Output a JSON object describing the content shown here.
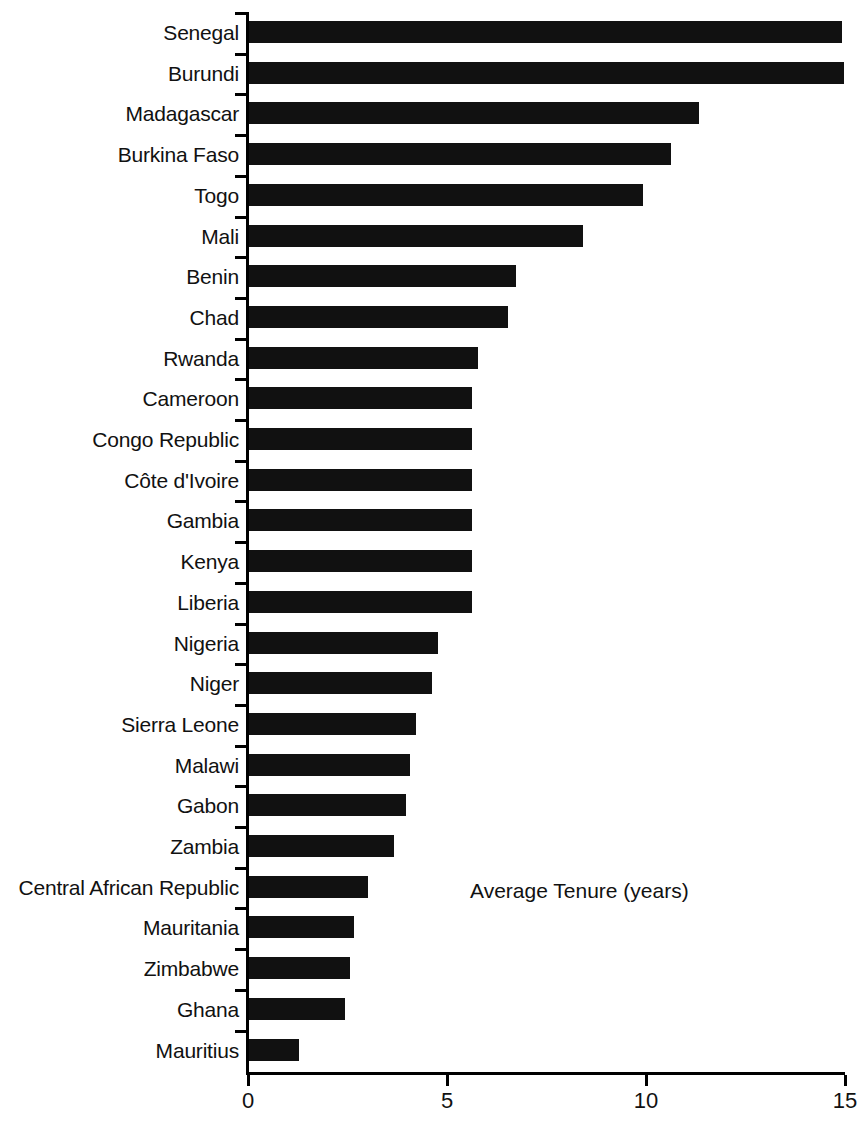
{
  "chart_data": {
    "type": "bar",
    "orientation": "horizontal",
    "title": "",
    "subtitle": "",
    "xlabel": "Average Tenure (years)",
    "ylabel": "",
    "annotation": "Average Tenure (years)",
    "xlim": [
      0,
      15
    ],
    "x_ticks": [
      0,
      5,
      10,
      15
    ],
    "x_tick_labels": [
      "0",
      "5",
      "10",
      "15"
    ],
    "grid": false,
    "legend": false,
    "bar_color": "#111111",
    "axis_color": "#000000",
    "background": "#ffffff",
    "categories": [
      "Senegal",
      "Burundi",
      "Madagascar",
      "Burkina Faso",
      "Togo",
      "Mali",
      "Benin",
      "Chad",
      "Rwanda",
      "Cameroon",
      "Congo Republic",
      "Côte d'Ivoire",
      "Gambia",
      "Kenya",
      "Liberia",
      "Nigeria",
      "Niger",
      "Sierra Leone",
      "Malawi",
      "Gabon",
      "Zambia",
      "Central African Republic",
      "Mauritania",
      "Zimbabwe",
      "Ghana",
      "Mauritius"
    ],
    "values": [
      14.9,
      14.95,
      11.3,
      10.6,
      9.9,
      8.4,
      6.7,
      6.5,
      5.75,
      5.6,
      5.6,
      5.6,
      5.6,
      5.6,
      5.6,
      4.75,
      4.6,
      4.2,
      4.05,
      3.95,
      3.65,
      3.0,
      2.65,
      2.55,
      2.4,
      1.25
    ]
  }
}
